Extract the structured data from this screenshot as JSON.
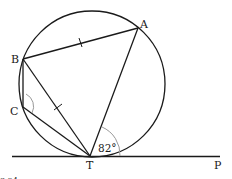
{
  "diagram": {
    "points": {
      "A": {
        "label": "A",
        "x": 138,
        "y": 28
      },
      "B": {
        "label": "B",
        "x": 23,
        "y": 59
      },
      "C": {
        "label": "C",
        "x": 23,
        "y": 107
      },
      "T": {
        "label": "T",
        "x": 90,
        "y": 156
      },
      "P": {
        "label": "P"
      }
    },
    "circle": {
      "cx": 92,
      "cy": 84,
      "r": 73
    },
    "tangent": {
      "from": "left-edge",
      "through": "T",
      "to": "P"
    },
    "segments": [
      "AB",
      "BC",
      "CT",
      "BT",
      "AT"
    ],
    "equal_marks": [
      "AB",
      "BT"
    ],
    "angles": {
      "ATP": {
        "label": "82°",
        "value": 82
      },
      "BCT": {
        "label": "",
        "marked": true
      }
    },
    "caption_fragment": "3.24"
  },
  "colors": {
    "stroke": "#1a1a1a",
    "arc_mark": "#999999",
    "background": "#ffffff"
  }
}
